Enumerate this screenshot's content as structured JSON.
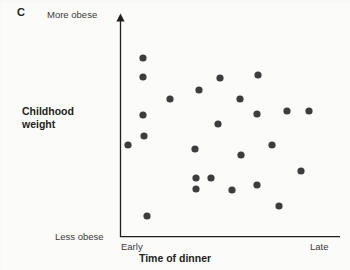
{
  "panel": {
    "label": "C"
  },
  "axis_labels": {
    "y_top": "More obese",
    "y_bottom": "Less obese",
    "x_left": "Early",
    "x_right": "Late"
  },
  "titles": {
    "y_axis_line1": "Childhood",
    "y_axis_line2": "weight",
    "x_axis": "Time of dinner"
  },
  "colors": {
    "point": "#3d3d3d",
    "axis": "#231f20",
    "text": "#231f20",
    "muted_text": "#3a3a3a",
    "background": "#fbfbfa"
  },
  "chart_data": {
    "type": "scatter",
    "title": "",
    "xlabel": "Time of dinner",
    "ylabel": "Childhood weight",
    "x_tick_labels": [
      "Early",
      "Late"
    ],
    "y_tick_labels": [
      "Less obese",
      "More obese"
    ],
    "xlim": [
      0,
      100
    ],
    "ylim": [
      0,
      100
    ],
    "grid": false,
    "legend": "none",
    "axis_style": {
      "y_axis_arrow": true,
      "x_axis_arrow": false,
      "spines": [
        "left",
        "bottom"
      ]
    },
    "point_count": 25,
    "point_radius_px": 3.6,
    "note": "No visible association between time of dinner and childhood weight",
    "series": [
      {
        "name": "children",
        "marker": "circle",
        "color": "#3d3d3d",
        "points": [
          {
            "px": 143,
            "py": 58,
            "x": 10.5,
            "y": 81.0
          },
          {
            "px": 143,
            "py": 77,
            "x": 10.5,
            "y": 72.4
          },
          {
            "px": 143,
            "py": 115,
            "x": 10.5,
            "y": 55.2
          },
          {
            "px": 144,
            "py": 136,
            "x": 10.9,
            "y": 45.7
          },
          {
            "px": 128,
            "py": 145,
            "x": 3.6,
            "y": 41.6
          },
          {
            "px": 147,
            "py": 216,
            "x": 12.3,
            "y": 9.5
          },
          {
            "px": 170,
            "py": 99,
            "x": 22.7,
            "y": 62.4
          },
          {
            "px": 199,
            "py": 90,
            "x": 35.9,
            "y": 66.5
          },
          {
            "px": 220,
            "py": 78,
            "x": 45.5,
            "y": 71.9
          },
          {
            "px": 218,
            "py": 124,
            "x": 44.5,
            "y": 51.1
          },
          {
            "px": 195,
            "py": 149,
            "x": 34.1,
            "y": 39.8
          },
          {
            "px": 196,
            "py": 178,
            "x": 34.5,
            "y": 26.7
          },
          {
            "px": 211,
            "py": 178,
            "x": 41.4,
            "y": 26.7
          },
          {
            "px": 196,
            "py": 189,
            "x": 34.5,
            "y": 21.7
          },
          {
            "px": 241,
            "py": 155,
            "x": 55.0,
            "y": 37.1
          },
          {
            "px": 240,
            "py": 99,
            "x": 54.5,
            "y": 62.4
          },
          {
            "px": 258,
            "py": 75,
            "x": 62.7,
            "y": 73.3
          },
          {
            "px": 257,
            "py": 114,
            "x": 62.3,
            "y": 55.7
          },
          {
            "px": 257,
            "py": 185,
            "x": 62.3,
            "y": 23.5
          },
          {
            "px": 272,
            "py": 145,
            "x": 69.1,
            "y": 41.6
          },
          {
            "px": 279,
            "py": 206,
            "x": 72.3,
            "y": 14.0
          },
          {
            "px": 287,
            "py": 111,
            "x": 75.9,
            "y": 57.0
          },
          {
            "px": 301,
            "py": 171,
            "x": 82.3,
            "y": 29.9
          },
          {
            "px": 309,
            "py": 111,
            "x": 85.9,
            "y": 57.0
          },
          {
            "px": 232,
            "py": 190,
            "x": 50.9,
            "y": 21.3
          }
        ]
      }
    ]
  },
  "geometry": {
    "origin_px": {
      "x": 120,
      "y": 237
    },
    "x_axis_end_px": 340,
    "y_axis_top_px": 16
  }
}
